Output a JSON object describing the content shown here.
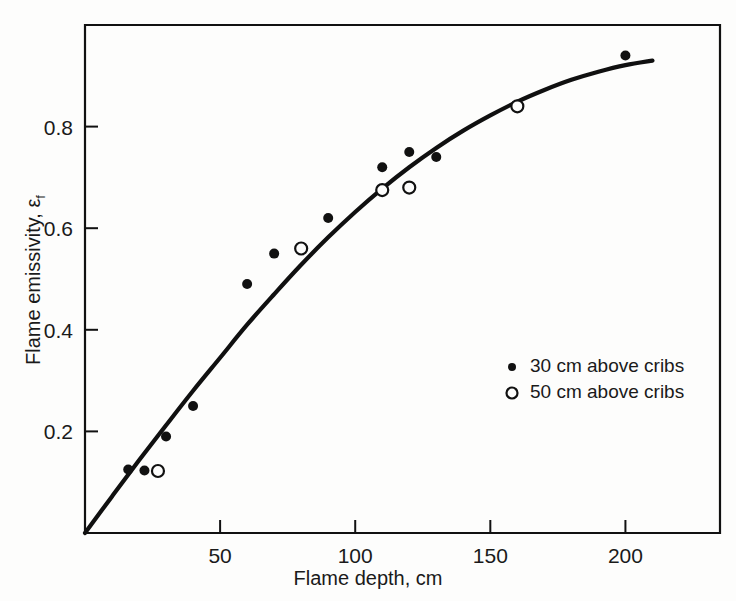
{
  "chart_data": {
    "type": "scatter",
    "title": "",
    "xlabel": "Flame depth, cm",
    "ylabel": "Flame emissivity, ε",
    "ylabel_subscript": "f",
    "xlim": [
      0,
      235
    ],
    "ylim": [
      0,
      1.0
    ],
    "xticks": [
      50,
      100,
      150,
      200
    ],
    "xtick_labels": [
      "50",
      "100",
      "150",
      "200"
    ],
    "yticks": [
      0.2,
      0.4,
      0.6,
      0.8
    ],
    "ytick_labels": [
      "0.2",
      "0.4",
      "0.6",
      "0.8"
    ],
    "grid": false,
    "frame": "box",
    "tick_direction": "in",
    "legend_position": "center-right",
    "series": [
      {
        "name": "30 cm above cribs",
        "marker": "filled-circle",
        "color": "#111111",
        "points": [
          {
            "x": 16,
            "y": 0.125
          },
          {
            "x": 22,
            "y": 0.123
          },
          {
            "x": 30,
            "y": 0.19
          },
          {
            "x": 40,
            "y": 0.25
          },
          {
            "x": 60,
            "y": 0.49
          },
          {
            "x": 70,
            "y": 0.55
          },
          {
            "x": 90,
            "y": 0.62
          },
          {
            "x": 110,
            "y": 0.72
          },
          {
            "x": 120,
            "y": 0.75
          },
          {
            "x": 130,
            "y": 0.74
          },
          {
            "x": 200,
            "y": 0.94
          }
        ]
      },
      {
        "name": "50 cm above cribs",
        "marker": "open-circle",
        "color": "#111111",
        "points": [
          {
            "x": 27,
            "y": 0.122
          },
          {
            "x": 80,
            "y": 0.56
          },
          {
            "x": 110,
            "y": 0.675
          },
          {
            "x": 120,
            "y": 0.68
          },
          {
            "x": 160,
            "y": 0.84
          }
        ]
      }
    ],
    "fit_curve": {
      "name": "fitted emissivity curve",
      "color": "#101010",
      "points": [
        {
          "x": 0,
          "y": 0.0
        },
        {
          "x": 10,
          "y": 0.072
        },
        {
          "x": 20,
          "y": 0.143
        },
        {
          "x": 30,
          "y": 0.212
        },
        {
          "x": 40,
          "y": 0.28
        },
        {
          "x": 50,
          "y": 0.345
        },
        {
          "x": 60,
          "y": 0.41
        },
        {
          "x": 70,
          "y": 0.47
        },
        {
          "x": 80,
          "y": 0.528
        },
        {
          "x": 90,
          "y": 0.582
        },
        {
          "x": 100,
          "y": 0.632
        },
        {
          "x": 110,
          "y": 0.678
        },
        {
          "x": 120,
          "y": 0.72
        },
        {
          "x": 130,
          "y": 0.758
        },
        {
          "x": 140,
          "y": 0.792
        },
        {
          "x": 150,
          "y": 0.822
        },
        {
          "x": 160,
          "y": 0.849
        },
        {
          "x": 170,
          "y": 0.872
        },
        {
          "x": 180,
          "y": 0.892
        },
        {
          "x": 190,
          "y": 0.908
        },
        {
          "x": 200,
          "y": 0.921
        },
        {
          "x": 210,
          "y": 0.93
        }
      ]
    },
    "legend_entries": [
      {
        "marker": "filled-circle",
        "label": "30 cm above cribs"
      },
      {
        "marker": "open-circle",
        "label": "50 cm above cribs"
      }
    ]
  }
}
